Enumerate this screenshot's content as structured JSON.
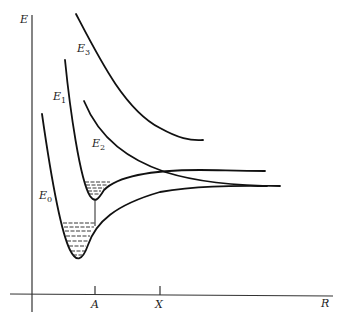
{
  "diagram": {
    "axes": {
      "y_label": "E",
      "x_label": "R",
      "ticks": [
        {
          "label": "A"
        },
        {
          "label": "X"
        }
      ]
    },
    "curves": [
      {
        "name": "E",
        "sub": "0"
      },
      {
        "name": "E",
        "sub": "1"
      },
      {
        "name": "E",
        "sub": "2"
      },
      {
        "name": "E",
        "sub": "3"
      }
    ]
  }
}
